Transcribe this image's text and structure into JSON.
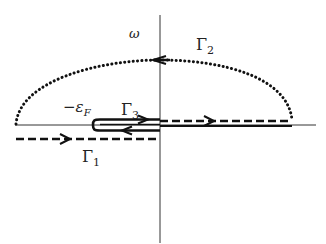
{
  "diagram": {
    "type": "contour-integration",
    "labels": {
      "omega": "ω",
      "gamma1": "Γ",
      "gamma1_sub": "1",
      "gamma2": "Γ",
      "gamma2_sub": "2",
      "gamma3": "Γ",
      "gamma3_sub": "3",
      "epsilon_minus": "−ε",
      "epsilon_sub": "F"
    },
    "colors": {
      "ink": "#111111",
      "axis": "#333333"
    },
    "elements": [
      {
        "name": "real-axis",
        "style": "thin-solid"
      },
      {
        "name": "imaginary-axis",
        "style": "thin-solid"
      },
      {
        "name": "contour-gamma1",
        "style": "dashed",
        "direction": "right",
        "position": "below real axis, left half"
      },
      {
        "name": "contour-gamma2",
        "style": "dotted-arc",
        "direction": "counterclockwise (leftward at top)",
        "position": "upper half plane"
      },
      {
        "name": "contour-gamma2-straight",
        "style": "dashed",
        "direction": "right",
        "position": "above real axis, right half"
      },
      {
        "name": "contour-gamma3",
        "style": "thick-solid keyhole",
        "direction": "right on top, left on bottom",
        "position": "around -εF to origin"
      }
    ]
  }
}
